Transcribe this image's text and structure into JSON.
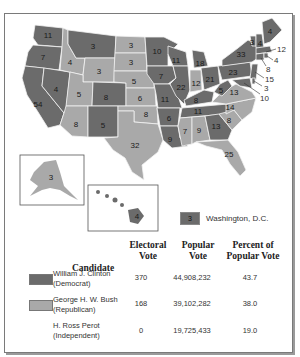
{
  "colors": {
    "democrat": "#6b6b6b",
    "republican": "#a9a9a9",
    "frame": "#7a7a7a",
    "state_border": "#f2f2f2"
  },
  "states": [
    {
      "abbr": "WA",
      "ev": 11,
      "party": "D"
    },
    {
      "abbr": "OR",
      "ev": 7,
      "party": "D"
    },
    {
      "abbr": "CA",
      "ev": 54,
      "party": "D"
    },
    {
      "abbr": "NV",
      "ev": 4,
      "party": "D"
    },
    {
      "abbr": "ID",
      "ev": 4,
      "party": "R"
    },
    {
      "abbr": "MT",
      "ev": 3,
      "party": "D"
    },
    {
      "abbr": "WY",
      "ev": 3,
      "party": "R"
    },
    {
      "abbr": "UT",
      "ev": 5,
      "party": "R"
    },
    {
      "abbr": "CO",
      "ev": 8,
      "party": "D"
    },
    {
      "abbr": "AZ",
      "ev": 8,
      "party": "R"
    },
    {
      "abbr": "NM",
      "ev": 5,
      "party": "D"
    },
    {
      "abbr": "ND",
      "ev": 3,
      "party": "R"
    },
    {
      "abbr": "SD",
      "ev": 3,
      "party": "R"
    },
    {
      "abbr": "NE",
      "ev": 5,
      "party": "R"
    },
    {
      "abbr": "KS",
      "ev": 6,
      "party": "R"
    },
    {
      "abbr": "OK",
      "ev": 8,
      "party": "R"
    },
    {
      "abbr": "TX",
      "ev": 32,
      "party": "R"
    },
    {
      "abbr": "MN",
      "ev": 10,
      "party": "D"
    },
    {
      "abbr": "IA",
      "ev": 7,
      "party": "D"
    },
    {
      "abbr": "MO",
      "ev": 11,
      "party": "D"
    },
    {
      "abbr": "AR",
      "ev": 6,
      "party": "D"
    },
    {
      "abbr": "LA",
      "ev": 9,
      "party": "D"
    },
    {
      "abbr": "WI",
      "ev": 11,
      "party": "D"
    },
    {
      "abbr": "IL",
      "ev": 22,
      "party": "D"
    },
    {
      "abbr": "MI",
      "ev": 18,
      "party": "D"
    },
    {
      "abbr": "IN",
      "ev": 12,
      "party": "R"
    },
    {
      "abbr": "OH",
      "ev": 21,
      "party": "D"
    },
    {
      "abbr": "KY",
      "ev": 8,
      "party": "D"
    },
    {
      "abbr": "TN",
      "ev": 11,
      "party": "D"
    },
    {
      "abbr": "MS",
      "ev": 7,
      "party": "R"
    },
    {
      "abbr": "AL",
      "ev": 9,
      "party": "R"
    },
    {
      "abbr": "GA",
      "ev": 13,
      "party": "D"
    },
    {
      "abbr": "FL",
      "ev": 25,
      "party": "R"
    },
    {
      "abbr": "SC",
      "ev": 8,
      "party": "R"
    },
    {
      "abbr": "NC",
      "ev": 14,
      "party": "R"
    },
    {
      "abbr": "VA",
      "ev": 13,
      "party": "R"
    },
    {
      "abbr": "WV",
      "ev": 5,
      "party": "D"
    },
    {
      "abbr": "PA",
      "ev": 23,
      "party": "D"
    },
    {
      "abbr": "NY",
      "ev": 33,
      "party": "D"
    },
    {
      "abbr": "VT",
      "ev": 3,
      "party": "D"
    },
    {
      "abbr": "NH",
      "ev": 4,
      "party": "D"
    },
    {
      "abbr": "ME",
      "ev": 4,
      "party": "D"
    },
    {
      "abbr": "MA",
      "ev": 12,
      "party": "D"
    },
    {
      "abbr": "RI",
      "ev": 4,
      "party": "D"
    },
    {
      "abbr": "CT",
      "ev": 8,
      "party": "D"
    },
    {
      "abbr": "NJ",
      "ev": 15,
      "party": "D"
    },
    {
      "abbr": "DE",
      "ev": 3,
      "party": "D"
    },
    {
      "abbr": "MD",
      "ev": 10,
      "party": "D"
    },
    {
      "abbr": "AK",
      "ev": 3,
      "party": "R"
    },
    {
      "abbr": "HI",
      "ev": 4,
      "party": "D"
    }
  ],
  "labels": {
    "WA": "11",
    "OR": "7",
    "CA": "54",
    "NV": "4",
    "ID": "4",
    "MT": "3",
    "WY": "3",
    "UT": "5",
    "CO": "8",
    "AZ": "8",
    "NM": "5",
    "ND": "3",
    "SD": "3",
    "NE": "5",
    "KS": "6",
    "OK": "8",
    "TX": "32",
    "MN": "10",
    "IA": "7",
    "MO": "11",
    "AR": "6",
    "LA": "9",
    "WI": "11",
    "IL": "22",
    "MI": "18",
    "IN": "12",
    "OH": "21",
    "KY": "8",
    "TN": "11",
    "MS": "7",
    "AL": "9",
    "GA": "13",
    "FL": "25",
    "SC": "8",
    "NC": "14",
    "VA": "13",
    "WV": "5",
    "PA": "23",
    "NY": "33",
    "VT": "3",
    "NH": "4",
    "ME": "4",
    "MA": "12",
    "RI": "4",
    "CT": "8",
    "NJ": "15",
    "DE": "3",
    "MD": "10",
    "AK": "3",
    "HI": "4"
  },
  "dc_legend": {
    "ev": "3",
    "label": "Washington, D.C."
  },
  "table": {
    "headers": {
      "candidate": "Candidate",
      "electoral_1": "Electoral",
      "electoral_2": "Vote",
      "popular_1": "Popular",
      "popular_2": "Vote",
      "percent_1": "Percent of",
      "percent_2": "Popular Vote"
    },
    "rows": [
      {
        "name": "William J. Clinton",
        "party": "(Democrat)",
        "electoral": "370",
        "popular": "44,908,232",
        "percent": "43.7"
      },
      {
        "name": "George H. W. Bush",
        "party": "(Republican)",
        "electoral": "168",
        "popular": "39,102,282",
        "percent": "38.0"
      },
      {
        "name": "H. Ross Perot",
        "party": "(Independent)",
        "electoral": "0",
        "popular": "19,725,433",
        "percent": "19.0"
      }
    ]
  }
}
